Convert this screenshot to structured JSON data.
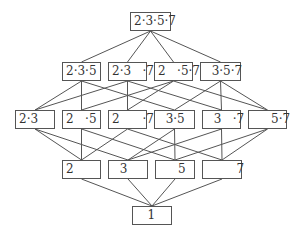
{
  "diagram": {
    "type": "divisor-lattice",
    "stroke_color": "#555555",
    "nodes": {
      "n2357": {
        "label": "2·3·5·7",
        "x": 130,
        "y": 12,
        "w": 41
      },
      "n235": {
        "label": "2·3·5",
        "x": 62,
        "y": 62,
        "w": 39
      },
      "n237": {
        "label": "2·3   ·7",
        "x": 108,
        "y": 62,
        "w": 39
      },
      "n257": {
        "label": "2   ·5·7",
        "x": 154,
        "y": 62,
        "w": 39
      },
      "n357": {
        "label": "  3·5·7",
        "x": 200,
        "y": 62,
        "w": 41
      },
      "n23": {
        "label": "2·3",
        "x": 15,
        "y": 110,
        "w": 40
      },
      "n25": {
        "label": "2   ·5",
        "x": 62,
        "y": 110,
        "w": 39
      },
      "n27": {
        "label": "2      ·7",
        "x": 108,
        "y": 110,
        "w": 39
      },
      "n35": {
        "label": "  3·5",
        "x": 154,
        "y": 110,
        "w": 41
      },
      "n37": {
        "label": "  3   ·7",
        "x": 202,
        "y": 110,
        "w": 39
      },
      "n57": {
        "label": "     5·7",
        "x": 248,
        "y": 110,
        "w": 39
      },
      "n2": {
        "label": "2",
        "x": 62,
        "y": 160,
        "w": 39
      },
      "n3": {
        "label": "  3",
        "x": 108,
        "y": 160,
        "w": 40
      },
      "n5": {
        "label": "     5",
        "x": 155,
        "y": 160,
        "w": 40
      },
      "n7": {
        "label": "        7",
        "x": 202,
        "y": 160,
        "w": 40
      },
      "n1": {
        "label": "   1",
        "x": 132,
        "y": 206,
        "w": 40
      }
    },
    "edges": [
      [
        "n2357",
        "n235"
      ],
      [
        "n2357",
        "n237"
      ],
      [
        "n2357",
        "n257"
      ],
      [
        "n2357",
        "n357"
      ],
      [
        "n235",
        "n23"
      ],
      [
        "n235",
        "n25"
      ],
      [
        "n235",
        "n35"
      ],
      [
        "n237",
        "n23"
      ],
      [
        "n237",
        "n27"
      ],
      [
        "n237",
        "n37"
      ],
      [
        "n257",
        "n25"
      ],
      [
        "n257",
        "n27"
      ],
      [
        "n257",
        "n57"
      ],
      [
        "n357",
        "n35"
      ],
      [
        "n357",
        "n37"
      ],
      [
        "n357",
        "n57"
      ],
      [
        "n23",
        "n2"
      ],
      [
        "n23",
        "n3"
      ],
      [
        "n25",
        "n2"
      ],
      [
        "n25",
        "n5"
      ],
      [
        "n27",
        "n2"
      ],
      [
        "n27",
        "n7"
      ],
      [
        "n35",
        "n3"
      ],
      [
        "n35",
        "n5"
      ],
      [
        "n37",
        "n3"
      ],
      [
        "n37",
        "n7"
      ],
      [
        "n57",
        "n5"
      ],
      [
        "n57",
        "n7"
      ],
      [
        "n2",
        "n1"
      ],
      [
        "n3",
        "n1"
      ],
      [
        "n5",
        "n1"
      ],
      [
        "n7",
        "n1"
      ]
    ]
  }
}
